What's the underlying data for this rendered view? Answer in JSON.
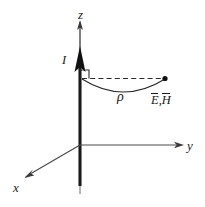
{
  "figure": {
    "type": "physics-coordinate-diagram",
    "background_color": "#ffffff",
    "ink_color": "#1a1a1a",
    "labels": {
      "z_axis": "z",
      "y_axis": "y",
      "x_axis": "x",
      "current": "I",
      "radius": "ρ",
      "field_point": "E,H",
      "field_point_e": "E",
      "field_point_separator": ",",
      "field_point_h": "H"
    },
    "elements": {
      "z_axis_arrow": "z-axis-arrow",
      "y_axis_arrow": "y-axis-arrow",
      "x_axis_arrow": "x-axis-arrow",
      "current_arrow": "current-direction-arrow",
      "wire": "vertical-current-wire",
      "dashed_radius": "dashed-radius-line",
      "arc": "rho-arc",
      "right_angle": "right-angle-marker",
      "point_marker": "field-point-dot"
    },
    "geometry": {
      "origin": [
        80,
        145
      ],
      "z_tip": [
        80,
        20
      ],
      "y_tip": [
        184,
        145
      ],
      "x_tip": [
        24,
        178
      ],
      "wire_bottom": [
        80,
        193
      ],
      "field_point": [
        165,
        78
      ],
      "dash_start": [
        85,
        78
      ],
      "arc_depth_px": 18
    }
  }
}
